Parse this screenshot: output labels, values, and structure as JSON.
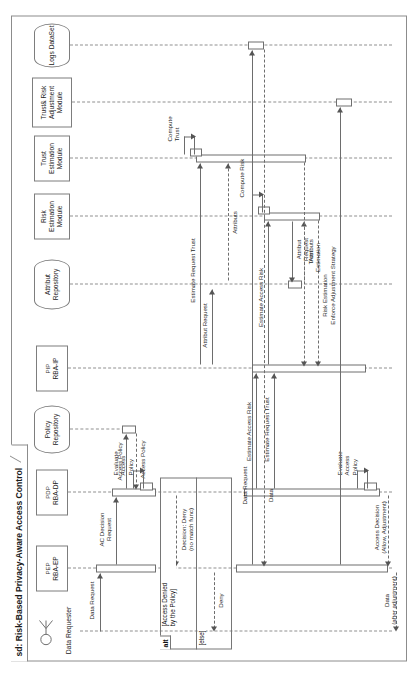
{
  "diagram": {
    "kind": "uml-sequence-diagram",
    "title": "sd: Risk-Based Privacy-Aware Access Control",
    "orientation": "rotated-90-ccw"
  },
  "lifelines": [
    {
      "id": "requester",
      "stereotype": "",
      "name": "Data Requester",
      "shape": "actor"
    },
    {
      "id": "pep",
      "stereotype": "PEP",
      "name": "RBA-EP",
      "shape": "box"
    },
    {
      "id": "pdp",
      "stereotype": "PDP",
      "name": "RBA-DP",
      "shape": "box"
    },
    {
      "id": "policyrepo",
      "stereotype": "",
      "name": "Policy Repository",
      "shape": "database"
    },
    {
      "id": "pip",
      "stereotype": "PIP",
      "name": "RBA-IP",
      "shape": "box"
    },
    {
      "id": "attrrepo",
      "stereotype": "",
      "name": "Attribut Repository",
      "shape": "database"
    },
    {
      "id": "riskmod",
      "stereotype": "",
      "name": "Risk Estimation Module",
      "shape": "box"
    },
    {
      "id": "trustmod",
      "stereotype": "",
      "name": "Trust Estimation Module",
      "shape": "box"
    },
    {
      "id": "tramod",
      "stereotype": "",
      "name": "Trust& Risk Adjustment Module",
      "shape": "box"
    },
    {
      "id": "logs",
      "stereotype": "",
      "name": "Logs DataSet",
      "shape": "database"
    }
  ],
  "messages": [
    {
      "id": "m1",
      "label": "Data Request",
      "from": "requester",
      "to": "pep",
      "style": "solid"
    },
    {
      "id": "m2",
      "label": "AC Decision\nRequest",
      "from": "pep",
      "to": "pdp",
      "style": "solid"
    },
    {
      "id": "m3",
      "label": "Access Policy",
      "from": "pdp",
      "to": "policyrepo",
      "style": "solid"
    },
    {
      "id": "m4",
      "label": "Access Policy",
      "from": "policyrepo",
      "to": "pdp",
      "style": "dashed"
    },
    {
      "id": "m5",
      "label": "Evaluate\nAccess\nPolicy",
      "from": "pdp",
      "to": "pdp",
      "style": "self"
    },
    {
      "id": "m6",
      "label": "Decision: Deny\n(no match func)",
      "from": "pdp",
      "to": "pep",
      "style": "dashed"
    },
    {
      "id": "m7",
      "label": "Deny",
      "from": "pep",
      "to": "requester",
      "style": "dashed"
    },
    {
      "id": "m8",
      "label": "Estimate Access Risk",
      "from": "pdp",
      "to": "pip",
      "style": "solid"
    },
    {
      "id": "m9",
      "label": "Estimate Request Trust",
      "from": "pdp",
      "to": "pip",
      "style": "solid"
    },
    {
      "id": "m10",
      "label": "Estimate Access Risk",
      "from": "pip",
      "to": "riskmod",
      "style": "solid"
    },
    {
      "id": "m11",
      "label": "Risk Estimation",
      "from": "riskmod",
      "to": "pip",
      "style": "dashed"
    },
    {
      "id": "m12",
      "label": "Estimate Request Trust",
      "from": "pip",
      "to": "trustmod",
      "style": "solid"
    },
    {
      "id": "m13",
      "label": "Attribut Request",
      "from": "pip",
      "to": "attrrepo",
      "style": "solid"
    },
    {
      "id": "m14",
      "label": "Attribut\nRequest",
      "from": "riskmod",
      "to": "attrrepo",
      "style": "solid"
    },
    {
      "id": "m15",
      "label": "Attributs",
      "from": "attrrepo",
      "to": "riskmod",
      "style": "dashed"
    },
    {
      "id": "m16",
      "label": "Attributs",
      "from": "attrrepo",
      "to": "trustmod",
      "style": "dashed"
    },
    {
      "id": "m17",
      "label": "Compute Risk",
      "from": "riskmod",
      "to": "riskmod",
      "style": "self"
    },
    {
      "id": "m18",
      "label": "Compute\nTrust",
      "from": "trustmod",
      "to": "trustmod",
      "style": "self"
    },
    {
      "id": "m19",
      "label": "Trust\nEstimation",
      "from": "trustmod",
      "to": "pip",
      "style": "dashed"
    },
    {
      "id": "m20",
      "label": "Evaluate\nAccess\nPolicy",
      "from": "pdp",
      "to": "pdp",
      "style": "self"
    },
    {
      "id": "m21",
      "label": "Access Decision\n(Allow, Adjustment)",
      "from": "pdp",
      "to": "pep",
      "style": "dashed"
    },
    {
      "id": "m22",
      "label": "Data\n(after adjustment)",
      "from": "pep",
      "to": "requester",
      "style": "dashed"
    },
    {
      "id": "m23",
      "label": "Enforce Adjustment Strategy",
      "from": "pep",
      "to": "tramod",
      "style": "solid"
    },
    {
      "id": "m24",
      "label": "Data Request",
      "from": "pep",
      "to": "logs",
      "style": "solid"
    },
    {
      "id": "m25",
      "label": "Data",
      "from": "logs",
      "to": "pep",
      "style": "dashed"
    }
  ],
  "fragment": {
    "operator": "alt",
    "guard_1": "[Access Denied\nby the Policy]",
    "guard_2": "[else]"
  }
}
